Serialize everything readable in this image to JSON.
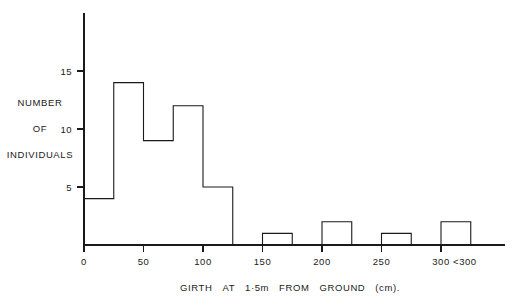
{
  "figure": {
    "y_axis_title_lines": [
      "NUMBER",
      "OF",
      "INDIVIDUALS"
    ],
    "x_axis_title_words": [
      "GIRTH",
      "AT",
      "1·5m",
      "FROM",
      "GROUND",
      "(cm)."
    ],
    "x_axis_title_full": "GIRTH AT 1·5m FROM GROUND (cm).",
    "ink_color": "#1a1a1a",
    "background_color": "#ffffff"
  },
  "chart_data": {
    "type": "bar",
    "title": "",
    "subtitle": "",
    "xlabel": "GIRTH AT 1·5m FROM GROUND (cm).",
    "ylabel": "NUMBER OF INDIVIDUALS",
    "grid": false,
    "legend": "none",
    "bin_width": 25,
    "xlim": [
      0,
      337.5
    ],
    "ylim": [
      0,
      16.5
    ],
    "x_ticks": [
      0,
      50,
      100,
      150,
      200,
      250,
      300
    ],
    "x_tick_labels": [
      "0",
      "50",
      "100",
      "150",
      "200",
      "250",
      "300"
    ],
    "extra_x_labels": [
      {
        "label": "<300",
        "position": 320
      }
    ],
    "y_ticks": [
      5,
      10,
      15
    ],
    "y_tick_labels": [
      "5",
      "10",
      "15"
    ],
    "categories": [
      "0-25",
      "25-50",
      "50-75",
      "75-100",
      "100-125",
      "125-150",
      "150-175",
      "175-200",
      "200-225",
      "225-250",
      "250-275",
      "275-300",
      "300-325"
    ],
    "bin_starts": [
      0,
      25,
      50,
      75,
      100,
      125,
      150,
      175,
      200,
      225,
      250,
      275,
      300
    ],
    "values": [
      4,
      14,
      9,
      12,
      5,
      0,
      1,
      0,
      2,
      0,
      1,
      0,
      2
    ]
  }
}
